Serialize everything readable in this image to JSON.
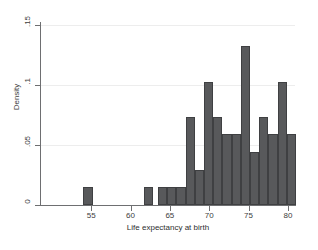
{
  "chart_data": {
    "type": "bar",
    "chart_subtype": "histogram",
    "title": "",
    "xlabel": "Life expectancy at birth",
    "ylabel": "Density",
    "xlim": [
      48.5,
      80.9
    ],
    "ylim": [
      0,
      0.1525
    ],
    "grid": true,
    "legend": null,
    "bar_color": "#58595b",
    "bar_edge_color": "#3f4042",
    "background_color": "#ffffff",
    "gridline_color": "#ededed",
    "axis_color": "#6e6f71",
    "bin_width": 1.17,
    "xticks": [
      55,
      60,
      65,
      70,
      75,
      80
    ],
    "xticklabels": [
      "55",
      "60",
      "65",
      "70",
      "75",
      "80"
    ],
    "yticks": [
      0,
      0.05,
      0.1,
      0.15
    ],
    "yticklabels": [
      "0",
      ".05",
      ".1",
      ".15"
    ],
    "bins": [
      {
        "x_left": 54.02,
        "x_right": 55.19,
        "density": 0.0147
      },
      {
        "x_left": 61.73,
        "x_right": 62.9,
        "density": 0.0147
      },
      {
        "x_left": 63.48,
        "x_right": 64.65,
        "density": 0.0147
      },
      {
        "x_left": 64.65,
        "x_right": 65.82,
        "density": 0.0147
      },
      {
        "x_left": 65.82,
        "x_right": 66.99,
        "density": 0.0147
      },
      {
        "x_left": 66.99,
        "x_right": 68.16,
        "density": 0.0735
      },
      {
        "x_left": 68.16,
        "x_right": 69.33,
        "density": 0.0294
      },
      {
        "x_left": 69.33,
        "x_right": 70.5,
        "density": 0.1029
      },
      {
        "x_left": 70.5,
        "x_right": 71.67,
        "density": 0.0735
      },
      {
        "x_left": 71.67,
        "x_right": 72.84,
        "density": 0.0588
      },
      {
        "x_left": 72.84,
        "x_right": 74.01,
        "density": 0.0588
      },
      {
        "x_left": 74.01,
        "x_right": 75.18,
        "density": 0.1324
      },
      {
        "x_left": 75.18,
        "x_right": 76.35,
        "density": 0.0441
      },
      {
        "x_left": 76.35,
        "x_right": 77.52,
        "density": 0.0735
      },
      {
        "x_left": 77.52,
        "x_right": 78.69,
        "density": 0.0588
      },
      {
        "x_left": 78.69,
        "x_right": 79.86,
        "density": 0.1029
      },
      {
        "x_left": 79.86,
        "x_right": 81.03,
        "density": 0.0588
      }
    ]
  }
}
